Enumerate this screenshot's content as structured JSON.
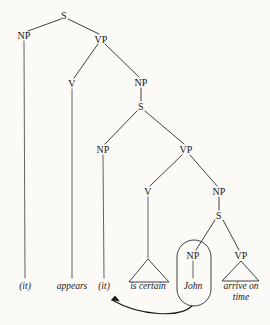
{
  "diagram": {
    "type": "syntax-tree",
    "background_color": "#fbfaf7",
    "line_color": "#2a2a2d",
    "nodes": [
      {
        "id": "s-top",
        "label": "S",
        "x": 64,
        "y": 16
      },
      {
        "id": "np-subject",
        "label": "NP",
        "x": 24,
        "y": 36
      },
      {
        "id": "vp-matrix",
        "label": "VP",
        "x": 101,
        "y": 40
      },
      {
        "id": "v-appears",
        "label": "V",
        "x": 72,
        "y": 84
      },
      {
        "id": "np-clause",
        "label": "NP",
        "x": 141,
        "y": 83
      },
      {
        "id": "s-embedded",
        "label": "S",
        "x": 141,
        "y": 107
      },
      {
        "id": "np-expl",
        "label": "NP",
        "x": 103,
        "y": 150
      },
      {
        "id": "vp-mid",
        "label": "VP",
        "x": 186,
        "y": 150
      },
      {
        "id": "v-certain",
        "label": "V",
        "x": 148,
        "y": 192
      },
      {
        "id": "np-lower",
        "label": "NP",
        "x": 219,
        "y": 192
      },
      {
        "id": "s-lower",
        "label": "S",
        "x": 219,
        "y": 216
      },
      {
        "id": "np-john",
        "label": "NP",
        "x": 193,
        "y": 256
      },
      {
        "id": "vp-lower",
        "label": "VP",
        "x": 241,
        "y": 256
      }
    ],
    "leaves": [
      {
        "id": "leaf-it-subject",
        "text": "(it)",
        "x": 25,
        "y": 286
      },
      {
        "id": "leaf-appears",
        "text": "appears",
        "x": 72,
        "y": 286
      },
      {
        "id": "leaf-it-expl",
        "text": "(it)",
        "x": 104,
        "y": 286
      },
      {
        "id": "leaf-is-certain",
        "text": "is certain",
        "x": 148,
        "y": 286
      },
      {
        "id": "leaf-john",
        "text": "John",
        "x": 193,
        "y": 286
      },
      {
        "id": "leaf-arrive",
        "text": "arrive on",
        "x": 241,
        "y": 286
      },
      {
        "id": "leaf-time",
        "text": "time",
        "x": 241,
        "y": 298
      }
    ],
    "annotations": {
      "circled_constituent": "John",
      "movement": "NP 'John' raises to the embedded subject position '(it)'"
    }
  }
}
